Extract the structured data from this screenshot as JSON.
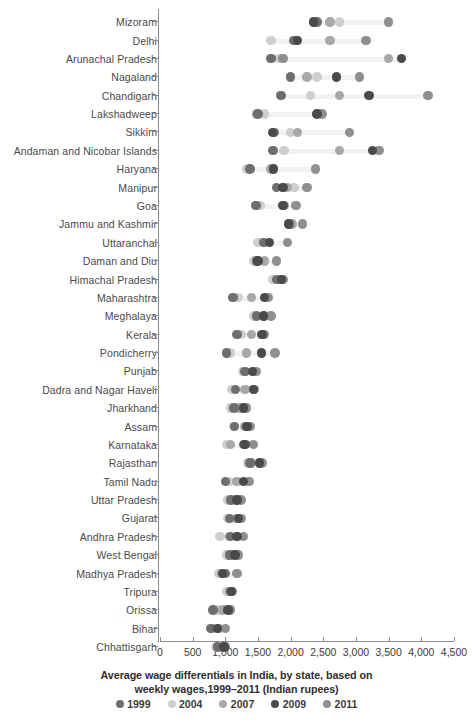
{
  "chart_data": {
    "type": "scatter",
    "title": "",
    "caption_line1": "Average wage differentials in India, by state, based on",
    "caption_line2": "weekly wages,1999–2011 (Indian rupees)",
    "xlabel": "",
    "ylabel": "",
    "xlim": [
      0,
      4500
    ],
    "xticks": [
      0,
      500,
      1000,
      1500,
      2000,
      2500,
      3000,
      3500,
      4000,
      4500
    ],
    "xticklabels": [
      "0",
      "500",
      "1,000",
      "1,500",
      "2,000",
      "2,500",
      "3,000",
      "3,500",
      "4,000",
      "4,500"
    ],
    "grid": false,
    "legend_position": "bottom",
    "series": [
      {
        "name": "1999",
        "color": "#6e6e6e"
      },
      {
        "name": "2004",
        "color": "#cfcfcf"
      },
      {
        "name": "2007",
        "color": "#a8a8a8"
      },
      {
        "name": "2009",
        "color": "#4a4a4a"
      },
      {
        "name": "2011",
        "color": "#8f8f8f"
      }
    ],
    "categories": [
      "Mizoram",
      "Delhi",
      "Arunachal Pradesh",
      "Nagaland",
      "Chandigarh",
      "Lakshadweep",
      "Sikkim",
      "Andaman and Nicobar Islands",
      "Haryana",
      "Manipur",
      "Goa",
      "Jammu and Kashmir",
      "Uttaranchal",
      "Daman and Diu",
      "Himachal Pradesh",
      "Maharashtra",
      "Meghalaya",
      "Kerala",
      "Pondicherry",
      "Punjab",
      "Dadra and Nagar Haveli",
      "Jharkhand",
      "Assam",
      "Karnataka",
      "Rajasthan",
      "Tamil Nadu",
      "Uttar Pradesh",
      "Gujarat",
      "Andhra Pradesh",
      "West Bengal",
      "Madhya Pradesh",
      "Tripura",
      "Orissa",
      "Bihar",
      "Chhattisgarh"
    ],
    "rows": [
      {
        "state": "Mizoram",
        "values": {
          "1999": 2400,
          "2004": 2750,
          "2007": 2600,
          "2009": 2350,
          "2011": 3500
        }
      },
      {
        "state": "Delhi",
        "values": {
          "1999": 2050,
          "2004": 1700,
          "2007": 2600,
          "2009": 2100,
          "2011": 3150
        }
      },
      {
        "state": "Arunachal Pradesh",
        "values": {
          "1999": 1700,
          "2004": 1820,
          "2007": 3500,
          "2009": 3700,
          "2011": 1880
        }
      },
      {
        "state": "Nagaland",
        "values": {
          "1999": 2000,
          "2004": 2400,
          "2007": 2250,
          "2009": 2700,
          "2011": 3050
        }
      },
      {
        "state": "Chandigarh",
        "values": {
          "1999": 1850,
          "2004": 2300,
          "2007": 2750,
          "2009": 3200,
          "2011": 4100
        }
      },
      {
        "state": "Lakshadweep",
        "values": {
          "1999": 1500,
          "2004": 1600,
          "2007": 1480,
          "2009": 2400,
          "2011": 2480
        }
      },
      {
        "state": "Sikkim",
        "values": {
          "1999": 1750,
          "2004": 2000,
          "2007": 2100,
          "2009": 1720,
          "2011": 2900
        }
      },
      {
        "state": "Andaman and Nicobar Islands",
        "values": {
          "1999": 1730,
          "2004": 1900,
          "2007": 2750,
          "2009": 3250,
          "2011": 3350
        }
      },
      {
        "state": "Haryana",
        "values": {
          "1999": 1380,
          "2004": 1330,
          "2007": 1700,
          "2009": 1740,
          "2011": 2380
        }
      },
      {
        "state": "Manipur",
        "values": {
          "1999": 1780,
          "2004": 2050,
          "2007": 1950,
          "2009": 1880,
          "2011": 2250
        }
      },
      {
        "state": "Goa",
        "values": {
          "1999": 1470,
          "2004": 1540,
          "2007": 1900,
          "2009": 1880,
          "2011": 2080
        }
      },
      {
        "state": "Jammu and Kashmir",
        "values": {
          "1999": 1980,
          "2004": 1980,
          "2007": 2020,
          "2009": 1970,
          "2011": 2180
        }
      },
      {
        "state": "Uttaranchal",
        "values": {
          "1999": 1580,
          "2004": 1500,
          "2007": 1600,
          "2009": 1680,
          "2011": 1950
        }
      },
      {
        "state": "Daman and Diu",
        "values": {
          "1999": 1480,
          "2004": 1440,
          "2007": 1600,
          "2009": 1500,
          "2011": 1780
        }
      },
      {
        "state": "Himachal Pradesh",
        "values": {
          "1999": 1780,
          "2004": 1720,
          "2007": 1820,
          "2009": 1860,
          "2011": 1880
        }
      },
      {
        "state": "Maharashtra",
        "values": {
          "1999": 1120,
          "2004": 1200,
          "2007": 1400,
          "2009": 1600,
          "2011": 1650
        }
      },
      {
        "state": "Meghalaya",
        "values": {
          "1999": 1480,
          "2004": 1440,
          "2007": 1600,
          "2009": 1580,
          "2011": 1700
        }
      },
      {
        "state": "Kerala",
        "values": {
          "1999": 1180,
          "2004": 1250,
          "2007": 1400,
          "2009": 1560,
          "2011": 1600
        }
      },
      {
        "state": "Pondicherry",
        "values": {
          "1999": 1020,
          "2004": 1080,
          "2007": 1320,
          "2009": 1550,
          "2011": 1760
        }
      },
      {
        "state": "Punjab",
        "values": {
          "1999": 1300,
          "2004": 1260,
          "2007": 1450,
          "2009": 1420,
          "2011": 1480
        }
      },
      {
        "state": "Dadra and Nagar Haveli",
        "values": {
          "1999": 1160,
          "2004": 1100,
          "2007": 1300,
          "2009": 1430,
          "2011": 1440
        }
      },
      {
        "state": "Jharkhand",
        "values": {
          "1999": 1130,
          "2004": 1080,
          "2007": 1220,
          "2009": 1280,
          "2011": 1320
        }
      },
      {
        "state": "Assam",
        "values": {
          "1999": 1140,
          "2004": 1130,
          "2007": 1290,
          "2009": 1330,
          "2011": 1380
        }
      },
      {
        "state": "Karnataka",
        "values": {
          "1999": 1280,
          "2004": 1020,
          "2007": 1080,
          "2009": 1300,
          "2011": 1430
        }
      },
      {
        "state": "Rajasthan",
        "values": {
          "1999": 1380,
          "2004": 1340,
          "2007": 1400,
          "2009": 1520,
          "2011": 1560
        }
      },
      {
        "state": "Tamil Nadu",
        "values": {
          "1999": 1000,
          "2004": 1060,
          "2007": 1180,
          "2009": 1280,
          "2011": 1360
        }
      },
      {
        "state": "Uttar Pradesh",
        "values": {
          "1999": 1080,
          "2004": 1040,
          "2007": 1140,
          "2009": 1180,
          "2011": 1240
        }
      },
      {
        "state": "Gujarat",
        "values": {
          "1999": 1060,
          "2004": 1040,
          "2007": 1160,
          "2009": 1200,
          "2011": 1250
        }
      },
      {
        "state": "Andhra Pradesh",
        "values": {
          "1999": 1080,
          "2004": 920,
          "2007": 1060,
          "2009": 1180,
          "2011": 1280
        }
      },
      {
        "state": "West Bengal",
        "values": {
          "1999": 1060,
          "2004": 1020,
          "2007": 1100,
          "2009": 1150,
          "2011": 1200
        }
      },
      {
        "state": "Madhya Pradesh",
        "values": {
          "1999": 1000,
          "2004": 900,
          "2007": 940,
          "2009": 960,
          "2011": 1180
        }
      },
      {
        "state": "Tripura",
        "values": {
          "1999": 1080,
          "2004": 1020,
          "2007": 1060,
          "2009": 1090,
          "2011": 1100
        }
      },
      {
        "state": "Orissa",
        "values": {
          "1999": 810,
          "2004": 880,
          "2007": 960,
          "2009": 1040,
          "2011": 1080
        }
      },
      {
        "state": "Bihar",
        "values": {
          "1999": 780,
          "2004": 830,
          "2007": 900,
          "2009": 880,
          "2011": 1000
        }
      },
      {
        "state": "Chhattisgarh",
        "values": {
          "1999": 880,
          "2004": 860,
          "2007": 960,
          "2009": 980,
          "2011": 1000
        }
      }
    ]
  }
}
